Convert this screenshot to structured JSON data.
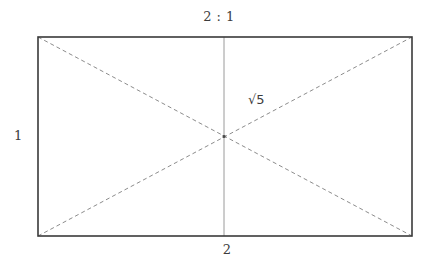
{
  "figure": {
    "title_label": "2 : 1",
    "height_label": "1",
    "width_label": "2",
    "diagonal_label": "√5",
    "colors": {
      "background": "#ffffff",
      "rectangle_stroke": "#3a3a3a",
      "diagonal_stroke": "#8c8c8c",
      "midline_stroke": "#9a9a9a",
      "text": "#3c3c3c",
      "center_dot": "#4a4a4a"
    },
    "geometry": {
      "rect_left": 38,
      "rect_top": 37,
      "rect_right": 412,
      "rect_bottom": 236,
      "rect_width": 374,
      "rect_height": 199,
      "center_x": 224,
      "center_y": 136.5,
      "rect_stroke_width": 1.6,
      "diagonal_stroke_width": 1,
      "diagonal_dash": "4 3",
      "midline_stroke_width": 1
    }
  }
}
